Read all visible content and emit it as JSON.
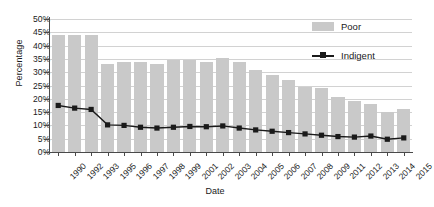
{
  "chart_data": {
    "type": "bar",
    "title": "",
    "xlabel": "Date",
    "ylabel": "Percentage",
    "ylim": [
      0,
      50
    ],
    "ytick_step": 5,
    "ytick_labels": [
      "0%",
      "5%",
      "10%",
      "15%",
      "20%",
      "25%",
      "30%",
      "35%",
      "40%",
      "45%",
      "50%"
    ],
    "grid": true,
    "legend_position": "top-right",
    "categories": [
      "1990",
      "1992",
      "1993",
      "1995",
      "1996",
      "1997",
      "1998",
      "1999",
      "2001",
      "2002",
      "2003",
      "2004",
      "2005",
      "2006",
      "2007",
      "2008",
      "2009",
      "2011",
      "2012",
      "2013",
      "2014",
      "2015"
    ],
    "series": [
      {
        "name": "Poor",
        "type": "bar",
        "color": "#c9c9c9",
        "values": [
          44,
          44,
          44,
          33,
          34,
          34,
          33,
          34.5,
          34.5,
          34,
          35.5,
          34,
          31,
          29,
          27,
          24.5,
          24,
          20.5,
          19,
          18,
          15,
          16
        ]
      },
      {
        "name": "Indigent",
        "type": "line",
        "color": "#1a1a1a",
        "marker": "square",
        "values": [
          17.5,
          16.5,
          16,
          10.2,
          10,
          9.3,
          9,
          9.3,
          9.6,
          9.5,
          9.8,
          9,
          8.3,
          7.8,
          7.3,
          6.8,
          6.3,
          5.8,
          5.6,
          6,
          4.8,
          5.3
        ]
      }
    ]
  },
  "legend": {
    "poor_label": "Poor",
    "indigent_label": "Indigent"
  },
  "axes": {
    "y_title": "Percentage",
    "x_title": "Date"
  }
}
